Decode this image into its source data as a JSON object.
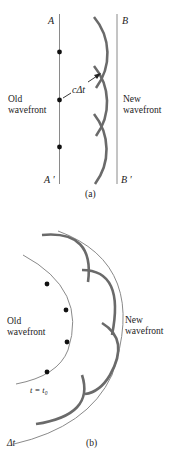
{
  "figure_a": {
    "label_A": "A",
    "label_B": "B",
    "label_A_prime": "A ′",
    "label_B_prime": "B ′",
    "old_wavefront_line1": "Old",
    "old_wavefront_line2": "wavefront",
    "new_wavefront_line1": "New",
    "new_wavefront_line2": "wavefront",
    "distance_label": "cΔt",
    "caption": "(a)"
  },
  "figure_b": {
    "old_wavefront_line1": "Old",
    "old_wavefront_line2": "wavefront",
    "new_wavefront_line1": "New",
    "new_wavefront_line2": "wavefront",
    "time_label": "t = t₀",
    "delta_label": "Δt",
    "caption": "(b)"
  },
  "colors": {
    "thin_line": "#888888",
    "thick_arc": "#6a6a6a",
    "dot": "#111111",
    "text": "#222222"
  }
}
